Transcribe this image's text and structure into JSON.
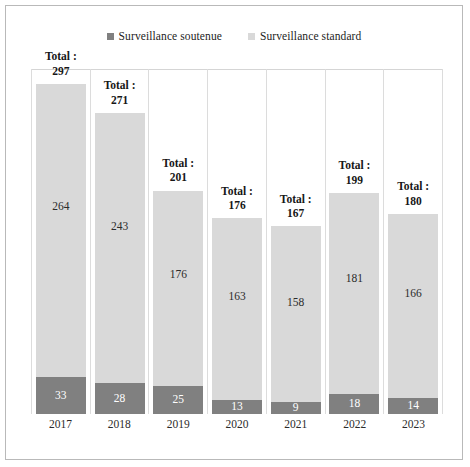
{
  "chart_data": {
    "type": "bar",
    "stacked": true,
    "orientation": "vertical",
    "title": "",
    "subtitle": "",
    "xlabel": "",
    "ylabel": "",
    "grid": false,
    "axis_visible": false,
    "ylim": [
      0,
      345
    ],
    "legend_position": "top-center",
    "categories": [
      "2017",
      "2018",
      "2019",
      "2020",
      "2021",
      "2022",
      "2023"
    ],
    "series": [
      {
        "name": "Surveillance soutenue",
        "color": "#808080",
        "values": [
          33,
          28,
          25,
          13,
          9,
          18,
          14
        ]
      },
      {
        "name": "Surveillance standard",
        "color": "#d9d9d9",
        "values": [
          264,
          243,
          176,
          163,
          158,
          181,
          166
        ]
      }
    ],
    "totals": [
      297,
      271,
      201,
      176,
      167,
      199,
      180
    ],
    "total_prefix": "Total :",
    "annotations": [
      {
        "category": "2017",
        "text": "Total : 297"
      },
      {
        "category": "2018",
        "text": "Total : 271"
      },
      {
        "category": "2019",
        "text": "Total : 201"
      },
      {
        "category": "2020",
        "text": "Total : 176"
      },
      {
        "category": "2021",
        "text": "Total : 167"
      },
      {
        "category": "2022",
        "text": "Total : 199"
      },
      {
        "category": "2023",
        "text": "Total : 180"
      }
    ]
  },
  "legend": {
    "items": [
      {
        "label": "Surveillance soutenue",
        "color": "#808080"
      },
      {
        "label": "Surveillance standard",
        "color": "#d9d9d9"
      }
    ]
  },
  "colors": {
    "soutenue": "#808080",
    "standard": "#d9d9d9",
    "frame": "#b9b9b9",
    "gridline": "#dcdcdc"
  }
}
